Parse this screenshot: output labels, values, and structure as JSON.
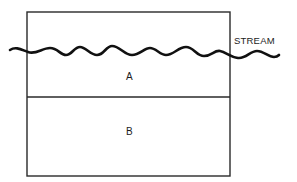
{
  "diagram": {
    "title": "",
    "regions": [
      {
        "id": "A",
        "label": "A"
      },
      {
        "id": "B",
        "label": "B"
      }
    ],
    "stream": {
      "label": "STREAM"
    },
    "colors": {
      "line": "#222222",
      "stream": "#111111",
      "background": "#ffffff",
      "text": "#1c1c1c"
    }
  }
}
